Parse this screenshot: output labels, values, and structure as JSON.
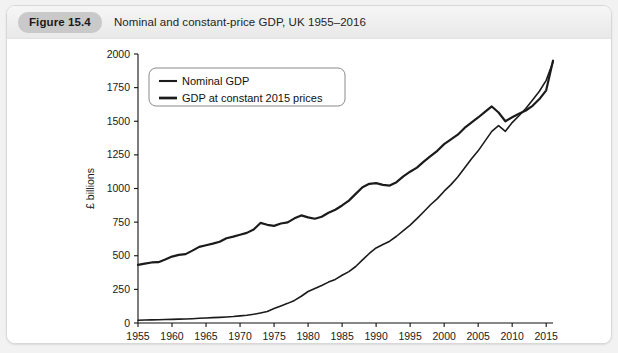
{
  "figure": {
    "badge_label": "Figure 15.4",
    "title": "Nominal and constant-price GDP, UK 1955–2016"
  },
  "chart_data": {
    "type": "line",
    "title": "Nominal and constant-price GDP, UK 1955–2016",
    "xlabel": "",
    "ylabel": "£ billions",
    "xlim": [
      1955,
      2016
    ],
    "ylim": [
      0,
      2000
    ],
    "grid": false,
    "legend_position": "top-left",
    "xticks": [
      1955,
      1960,
      1965,
      1970,
      1975,
      1980,
      1985,
      1990,
      1995,
      2000,
      2005,
      2010,
      2015
    ],
    "xtick_labels": [
      "1955",
      "1960",
      "1965",
      "1970",
      "1975",
      "1980",
      "1985",
      "1990",
      "1995",
      "2000",
      "2005",
      "2010",
      "2015"
    ],
    "yticks": [
      0,
      250,
      500,
      750,
      1000,
      1250,
      1500,
      1750,
      2000
    ],
    "ytick_labels": [
      "0",
      "250",
      "500",
      "750",
      "1000",
      "1250",
      "1500",
      "1750",
      "2000"
    ],
    "x": [
      1955,
      1956,
      1957,
      1958,
      1959,
      1960,
      1961,
      1962,
      1963,
      1964,
      1965,
      1966,
      1967,
      1968,
      1969,
      1970,
      1971,
      1972,
      1973,
      1974,
      1975,
      1976,
      1977,
      1978,
      1979,
      1980,
      1981,
      1982,
      1983,
      1984,
      1985,
      1986,
      1987,
      1988,
      1989,
      1990,
      1991,
      1992,
      1993,
      1994,
      1995,
      1996,
      1997,
      1998,
      1999,
      2000,
      2001,
      2002,
      2003,
      2004,
      2005,
      2006,
      2007,
      2008,
      2009,
      2010,
      2011,
      2012,
      2013,
      2014,
      2015,
      2016
    ],
    "series": [
      {
        "name": "Nominal GDP",
        "line_width": 1.6,
        "color": "#1b1b1b",
        "values": [
          20,
          22,
          23,
          24,
          26,
          27,
          29,
          30,
          32,
          35,
          37,
          40,
          42,
          45,
          48,
          53,
          58,
          65,
          75,
          86,
          108,
          127,
          146,
          168,
          199,
          234,
          257,
          279,
          304,
          324,
          355,
          382,
          420,
          469,
          517,
          558,
          584,
          608,
          645,
          687,
          728,
          776,
          827,
          879,
          925,
          980,
          1029,
          1086,
          1152,
          1220,
          1280,
          1352,
          1425,
          1468,
          1425,
          1490,
          1541,
          1595,
          1658,
          1723,
          1804,
          1940
        ]
      },
      {
        "name": "GDP at constant 2015 prices",
        "line_width": 2.2,
        "color": "#1b1b1b",
        "values": [
          432,
          442,
          450,
          452,
          472,
          494,
          506,
          512,
          538,
          566,
          578,
          590,
          604,
          630,
          642,
          656,
          670,
          695,
          744,
          730,
          722,
          740,
          748,
          778,
          800,
          785,
          775,
          790,
          820,
          842,
          874,
          910,
          960,
          1010,
          1035,
          1040,
          1027,
          1022,
          1047,
          1090,
          1125,
          1155,
          1200,
          1240,
          1280,
          1330,
          1365,
          1400,
          1450,
          1490,
          1528,
          1570,
          1610,
          1565,
          1500,
          1530,
          1555,
          1580,
          1615,
          1665,
          1730,
          1950
        ]
      }
    ]
  },
  "legend": {
    "entries": [
      {
        "label": "Nominal GDP"
      },
      {
        "label": "GDP at constant 2015 prices"
      }
    ]
  }
}
